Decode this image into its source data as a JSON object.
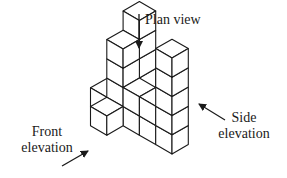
{
  "labels": {
    "plan": "Plan view",
    "side_line1": "Side",
    "side_line2": "elevation",
    "front_line1": "Front",
    "front_line2": "elevation"
  },
  "colors": {
    "stroke": "#1a1a1a",
    "fill": "#ffffff"
  },
  "projection": {
    "origin": [
      172,
      154
    ],
    "ix": [
      -16.3,
      -9.4
    ],
    "iy": [
      16.3,
      -9.4
    ],
    "iz": [
      0,
      -19.2
    ]
  },
  "cubes": [
    [
      0,
      0,
      0
    ],
    [
      0,
      0,
      1
    ],
    [
      0,
      0,
      2
    ],
    [
      0,
      0,
      3
    ],
    [
      0,
      0,
      4
    ],
    [
      1,
      0,
      0
    ],
    [
      2,
      0,
      0
    ],
    [
      3,
      0,
      0
    ],
    [
      4,
      0,
      0
    ],
    [
      1,
      0,
      1
    ],
    [
      2,
      0,
      1
    ],
    [
      3,
      0,
      1
    ],
    [
      3,
      0,
      2
    ],
    [
      3,
      0,
      3
    ],
    [
      3,
      -1,
      0
    ],
    [
      3,
      1,
      0
    ],
    [
      3,
      1,
      1
    ],
    [
      3,
      1,
      2
    ],
    [
      3,
      1,
      3
    ],
    [
      3,
      1,
      4
    ]
  ],
  "arrows": [
    {
      "name": "plan-view-arrow",
      "from": [
        139,
        14
      ],
      "to": [
        139,
        48
      ]
    },
    {
      "name": "side-elevation-arrow",
      "from": [
        225,
        120
      ],
      "to": [
        199,
        104
      ]
    },
    {
      "name": "front-elevation-arrow",
      "from": [
        62,
        166
      ],
      "to": [
        88,
        151
      ]
    }
  ]
}
